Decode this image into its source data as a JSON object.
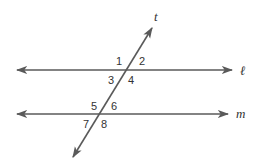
{
  "diagram": {
    "colors": {
      "line": "#5a5a5a",
      "text": "#333333",
      "background": "#ffffff"
    },
    "lines": {
      "l": {
        "label": "ℓ",
        "x1": 17,
        "y1": 70,
        "x2": 232,
        "y2": 70
      },
      "m": {
        "label": "m",
        "x1": 17,
        "y1": 114,
        "x2": 228,
        "y2": 114
      },
      "t": {
        "label": "t",
        "x1": 152,
        "y1": 28,
        "x2": 73,
        "y2": 157
      }
    },
    "angles": [
      {
        "num": "1",
        "x": 117,
        "y": 65
      },
      {
        "num": "2",
        "x": 139,
        "y": 65
      },
      {
        "num": "3",
        "x": 108,
        "y": 83
      },
      {
        "num": "4",
        "x": 128,
        "y": 83
      },
      {
        "num": "5",
        "x": 91,
        "y": 109
      },
      {
        "num": "6",
        "x": 111,
        "y": 109
      },
      {
        "num": "7",
        "x": 83,
        "y": 127
      },
      {
        "num": "8",
        "x": 101,
        "y": 127
      }
    ]
  }
}
